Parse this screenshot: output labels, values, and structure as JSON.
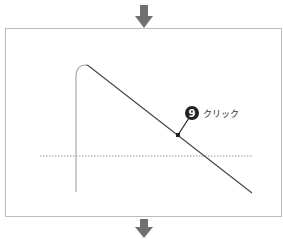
{
  "diagram": {
    "step_badge": {
      "number": "9",
      "color": "#222222"
    },
    "callout_label": "クリック",
    "colors": {
      "arrow": "#707070",
      "frame": "#bdbdbd",
      "curve_light": "#a8a8a8",
      "curve_dark": "#4a4a4a",
      "dotted": "#9a9a9a"
    },
    "arrows": [
      {
        "name": "top-down-arrow",
        "direction": "down"
      },
      {
        "name": "bottom-down-arrow",
        "direction": "down"
      }
    ]
  }
}
